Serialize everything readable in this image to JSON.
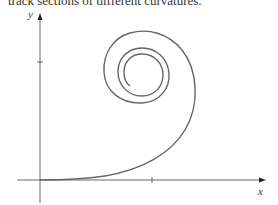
{
  "caption": "track sections of different curvatures.",
  "figure": {
    "x_label": "x",
    "y_label": "y",
    "curve": "spiral (clothoid / Euler spiral) starting tangent to x-axis at origin",
    "colors": {
      "axis": "#444444",
      "curve": "#666666"
    }
  }
}
